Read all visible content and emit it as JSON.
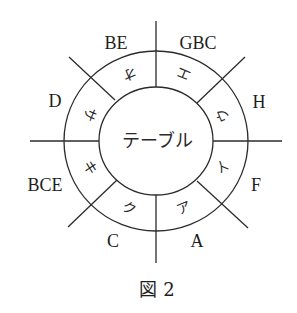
{
  "figure": {
    "caption": "図 2",
    "center_label": "テーブル",
    "stroke_color": "#2b2b2b",
    "outer_labels": [
      {
        "id": "be",
        "text": "BE"
      },
      {
        "id": "gbc",
        "text": "GBC"
      },
      {
        "id": "h",
        "text": "H"
      },
      {
        "id": "f",
        "text": "F"
      },
      {
        "id": "a",
        "text": "A"
      },
      {
        "id": "c",
        "text": "C"
      },
      {
        "id": "bce",
        "text": "BCE"
      },
      {
        "id": "d",
        "text": "D"
      }
    ],
    "seats": [
      {
        "id": "a",
        "text": "ア"
      },
      {
        "id": "i",
        "text": "イ"
      },
      {
        "id": "u",
        "text": "ウ"
      },
      {
        "id": "e",
        "text": "エ"
      },
      {
        "id": "o",
        "text": "オ"
      },
      {
        "id": "sa",
        "text": "サ"
      },
      {
        "id": "ki",
        "text": "キ"
      },
      {
        "id": "ku",
        "text": "ク"
      }
    ]
  }
}
